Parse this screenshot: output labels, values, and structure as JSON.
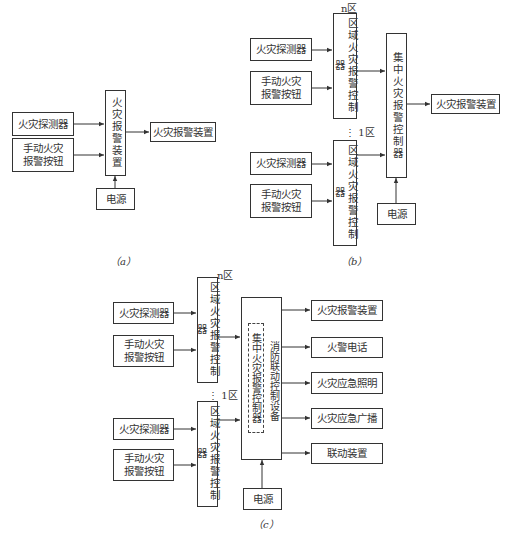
{
  "diagram_a": {
    "caption": "（a）",
    "detector": "火灾探测器",
    "manual_button": "手动火灾\n报警按钮",
    "controller": "火灾报警装置",
    "output": "火灾报警装置",
    "power": "电源"
  },
  "diagram_b": {
    "caption": "（b）",
    "zone_n_label": "n区",
    "zone_1_label": "⋮ 1区",
    "zone_n": {
      "detector": "火灾探测器",
      "manual_button": "手动火灾\n报警按钮",
      "controller": "区域火灾报警控制器"
    },
    "zone_1": {
      "detector": "火灾探测器",
      "manual_button": "手动火灾\n报警按钮",
      "controller": "区域火灾报警控制器"
    },
    "central_controller": "集中火灾报警控制器",
    "output": "火灾报警装置",
    "power": "电源"
  },
  "diagram_c": {
    "caption": "（c）",
    "zone_n_label": "n区",
    "zone_1_label": "⋮ 1区",
    "zone_n": {
      "detector": "火灾探测器",
      "manual_button": "手动火灾\n报警按钮",
      "controller": "区域火灾报警控制器"
    },
    "zone_1": {
      "detector": "火灾探测器",
      "manual_button": "手动火灾\n报警按钮",
      "controller": "区域火灾报警控制器"
    },
    "central_inner": "集中火灾报警控制器",
    "central_linkage": "消防联动控制设备",
    "outputs": [
      "火灾报警装置",
      "火警电话",
      "火灾应急照明",
      "火灾应急广播",
      "联动装置"
    ],
    "power": "电源"
  }
}
